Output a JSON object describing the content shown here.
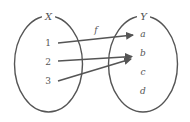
{
  "diagram": {
    "function_label": "f",
    "domain": {
      "label": "X",
      "elements": [
        "1",
        "2",
        "3"
      ]
    },
    "codomain": {
      "label": "Y",
      "elements": [
        "a",
        "b",
        "c",
        "d"
      ]
    },
    "mappings": [
      {
        "from": "1",
        "to": "a"
      },
      {
        "from": "2",
        "to": "b"
      },
      {
        "from": "3",
        "to": "b"
      }
    ],
    "colors": {
      "stroke": "#555555",
      "background": "#ffffff"
    }
  }
}
